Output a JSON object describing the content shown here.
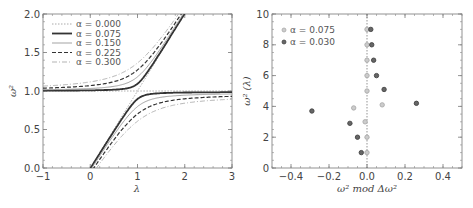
{
  "chart_data": [
    {
      "type": "line",
      "title": "",
      "xlabel": "λ",
      "ylabel": "ω²",
      "xlim": [
        -1,
        3
      ],
      "ylim": [
        0,
        2
      ],
      "xticks": [
        "−1",
        "0",
        "1",
        "2",
        "3"
      ],
      "yticks": [
        "0.0",
        "0.5",
        "1.0",
        "1.5",
        "2.0"
      ],
      "legend_position": "upper left",
      "grid": false,
      "series": [
        {
          "name": "α = 0.000",
          "style": "dotted",
          "color": "#aaaaaa",
          "alpha": 0.0
        },
        {
          "name": "α = 0.075",
          "style": "solid-thick",
          "color": "#333333",
          "alpha": 0.075
        },
        {
          "name": "α = 0.150",
          "style": "solid-thin",
          "color": "#999999",
          "alpha": 0.15
        },
        {
          "name": "α = 0.225",
          "style": "dashed",
          "color": "#333333",
          "alpha": 0.225
        },
        {
          "name": "α = 0.300",
          "style": "dash-dot",
          "color": "#aaaaaa",
          "alpha": 0.3
        }
      ],
      "description": "Two branches per α: lower branch ω² rises ~linearly from λ≈0 and saturates at ω²≈1; upper branch ω²≈1 for λ<1 then rises linearly to ω²=2 at λ≈2. Larger α widens the avoided crossing gap near λ=1."
    },
    {
      "type": "scatter",
      "title": "",
      "xlabel": "ω² mod Δω²",
      "ylabel": "ω² (λ)",
      "xlim": [
        -0.5,
        0.5
      ],
      "ylim": [
        0,
        10
      ],
      "xticks": [
        "−0.4",
        "−0.2",
        "0.0",
        "0.2",
        "0.4"
      ],
      "yticks": [
        "0",
        "2",
        "4",
        "6",
        "8",
        "10"
      ],
      "legend_position": "upper left",
      "grid": false,
      "reference_line": {
        "x": 0,
        "style": "dotted"
      },
      "series": [
        {
          "name": "α = 0.075",
          "color": "#aaaaaa",
          "points": [
            {
              "x": 0.0,
              "y": 1.0
            },
            {
              "x": 0.0,
              "y": 2.0
            },
            {
              "x": -0.01,
              "y": 3.0
            },
            {
              "x": -0.07,
              "y": 3.9
            },
            {
              "x": 0.08,
              "y": 4.1
            },
            {
              "x": 0.0,
              "y": 5.0
            },
            {
              "x": 0.0,
              "y": 6.0
            },
            {
              "x": 0.0,
              "y": 7.0
            },
            {
              "x": 0.0,
              "y": 8.0
            },
            {
              "x": 0.0,
              "y": 9.0
            }
          ]
        },
        {
          "name": "α = 0.030",
          "color": "#444444",
          "points": [
            {
              "x": -0.03,
              "y": 1.0
            },
            {
              "x": -0.05,
              "y": 2.0
            },
            {
              "x": -0.09,
              "y": 2.9
            },
            {
              "x": -0.29,
              "y": 3.7
            },
            {
              "x": 0.26,
              "y": 4.2
            },
            {
              "x": 0.09,
              "y": 5.1
            },
            {
              "x": 0.05,
              "y": 6.0
            },
            {
              "x": 0.035,
              "y": 7.0
            },
            {
              "x": 0.025,
              "y": 8.0
            },
            {
              "x": 0.02,
              "y": 9.0
            }
          ]
        }
      ]
    }
  ]
}
